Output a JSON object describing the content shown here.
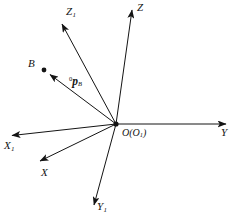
{
  "figure": {
    "type": "vector-coordinate-frame-diagram",
    "background_color": "#ffffff",
    "stroke_color": "#141414",
    "width": 237,
    "height": 221
  },
  "origin": {
    "label_main": "O",
    "label_paren_open": "(",
    "label_sub_base": "O",
    "label_sub_index": "1",
    "label_paren_close": ")",
    "x": 116,
    "y": 124
  },
  "axes": [
    {
      "name": "Z",
      "label_base": "Z",
      "label_sub": "",
      "tip_x": 132,
      "tip_y": 8,
      "label_x": 137,
      "label_y": 4
    },
    {
      "name": "Y",
      "label_base": "Y",
      "label_sub": "",
      "tip_x": 228,
      "tip_y": 124,
      "label_x": 222,
      "label_y": 130
    },
    {
      "name": "Z1",
      "label_base": "Z",
      "label_sub": "1",
      "tip_x": 60,
      "tip_y": 22,
      "label_x": 66,
      "label_y": 8
    },
    {
      "name": "X1",
      "label_base": "X",
      "label_sub": "1",
      "tip_x": 10,
      "tip_y": 136,
      "label_x": 5,
      "label_y": 141
    },
    {
      "name": "X",
      "label_base": "X",
      "label_sub": "",
      "tip_x": 38,
      "tip_y": 163,
      "label_x": 41,
      "label_y": 168
    },
    {
      "name": "Y1",
      "label_base": "Y",
      "label_sub": "1",
      "tip_x": 93,
      "tip_y": 208,
      "label_x": 97,
      "label_y": 203
    }
  ],
  "point_b": {
    "label": "B",
    "dot_x": 44,
    "dot_y": 70,
    "label_x": 29,
    "label_y": 62
  },
  "vector_p": {
    "superscript": "0",
    "symbol": "p",
    "subscript": "B",
    "from_x": 116,
    "from_y": 124,
    "to_x": 48,
    "to_y": 73,
    "label_x": 70,
    "label_y": 74
  }
}
